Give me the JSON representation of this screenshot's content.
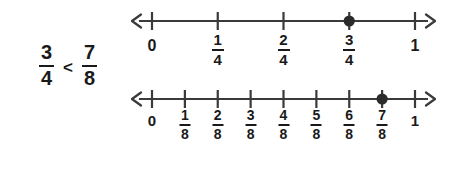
{
  "figure": {
    "background_color": "#ffffff",
    "ink_color": "#3a3a3a",
    "text_color": "#1a1a1a",
    "point_color": "#2b2b2b"
  },
  "comparison": {
    "left_fraction": {
      "numerator": "3",
      "denominator": "4"
    },
    "relation": "<",
    "right_fraction": {
      "numerator": "7",
      "denominator": "8"
    },
    "expression": "3/4 < 7/8"
  },
  "chart_data": {
    "type": "number-line",
    "lines": [
      {
        "name": "fourths-number-line",
        "denominator": 4,
        "axis_min": 0,
        "axis_max": 1,
        "arrow_left": true,
        "arrow_right": true,
        "tick_count": 5,
        "ticks": [
          {
            "value": 0,
            "label_type": "whole",
            "label": "0"
          },
          {
            "value": 0.25,
            "label_type": "fraction",
            "numerator": "1",
            "denominator": "4"
          },
          {
            "value": 0.5,
            "label_type": "fraction",
            "numerator": "2",
            "denominator": "4"
          },
          {
            "value": 0.75,
            "label_type": "fraction",
            "numerator": "3",
            "denominator": "4"
          },
          {
            "value": 1,
            "label_type": "whole",
            "label": "1"
          }
        ],
        "marked_point": {
          "value": 0.75,
          "label": "3/4",
          "style": "filled-dot"
        }
      },
      {
        "name": "eighths-number-line",
        "denominator": 8,
        "axis_min": 0,
        "axis_max": 1,
        "arrow_left": true,
        "arrow_right": true,
        "tick_count": 9,
        "ticks": [
          {
            "value": 0,
            "label_type": "whole",
            "label": "0"
          },
          {
            "value": 0.125,
            "label_type": "fraction",
            "numerator": "1",
            "denominator": "8"
          },
          {
            "value": 0.25,
            "label_type": "fraction",
            "numerator": "2",
            "denominator": "8"
          },
          {
            "value": 0.375,
            "label_type": "fraction",
            "numerator": "3",
            "denominator": "8"
          },
          {
            "value": 0.5,
            "label_type": "fraction",
            "numerator": "4",
            "denominator": "8"
          },
          {
            "value": 0.625,
            "label_type": "fraction",
            "numerator": "5",
            "denominator": "8"
          },
          {
            "value": 0.75,
            "label_type": "fraction",
            "numerator": "6",
            "denominator": "8"
          },
          {
            "value": 0.875,
            "label_type": "fraction",
            "numerator": "7",
            "denominator": "8"
          },
          {
            "value": 1,
            "label_type": "whole",
            "label": "1"
          }
        ],
        "marked_point": {
          "value": 0.875,
          "label": "7/8",
          "style": "filled-dot"
        }
      }
    ]
  }
}
